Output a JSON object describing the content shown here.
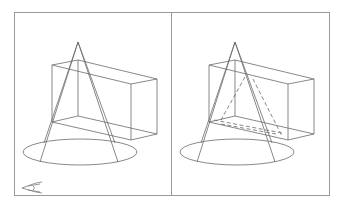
{
  "diagram": {
    "title": "",
    "colors": {
      "background": "#ffffff",
      "frame": "#9a9a9a",
      "line": "#6a6a6a"
    },
    "panels": [
      {
        "id": "left",
        "label": "",
        "shows_hidden_lines": false
      },
      {
        "id": "right",
        "label": "",
        "shows_hidden_lines": true
      }
    ],
    "icons": [
      {
        "name": "ucs-icon",
        "position": "bottom-left of left panel"
      }
    ]
  }
}
